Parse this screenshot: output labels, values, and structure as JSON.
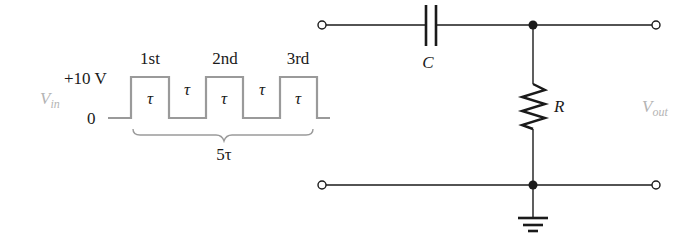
{
  "figure": {
    "type": "RC differentiator circuit with pulse-train input",
    "colors": {
      "wire": "#1a1a1a",
      "waveform": "#9a9a9a",
      "voltage_label": "#b4b4b4",
      "background": "#ffffff"
    }
  },
  "input_waveform": {
    "label_main": "V",
    "label_sub": "in",
    "high_level_label": "+10 V",
    "low_level_label": "0",
    "pulses": [
      {
        "label": "1st",
        "width_label": "τ"
      },
      {
        "label": "2nd",
        "width_label": "τ"
      },
      {
        "label": "3rd",
        "width_label": "τ"
      }
    ],
    "gaps": [
      {
        "width_label": "τ"
      },
      {
        "width_label": "τ"
      }
    ],
    "span_label": "5τ"
  },
  "circuit": {
    "capacitor": {
      "label": "C"
    },
    "resistor": {
      "label": "R"
    },
    "output": {
      "label_main": "V",
      "label_sub": "out"
    },
    "nodes": [
      "input-top-terminal",
      "input-bottom-terminal",
      "output-top-terminal",
      "output-bottom-terminal",
      "top-junction",
      "bottom-junction"
    ],
    "ground": "ground-symbol"
  }
}
